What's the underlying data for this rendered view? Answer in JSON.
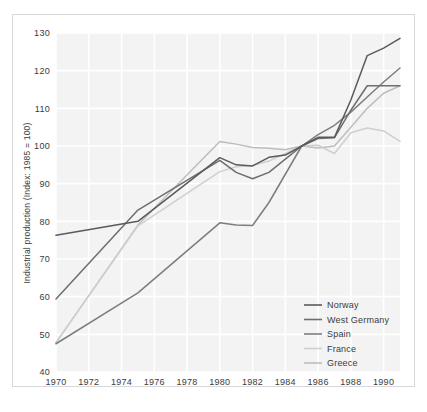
{
  "chart_data": {
    "type": "line",
    "title": "",
    "xlabel": "",
    "ylabel": "Industrial production (Index: 1985 = 100)",
    "xlim": [
      1970,
      1991
    ],
    "ylim": [
      40,
      130
    ],
    "xticks": [
      "1970",
      "1972",
      "1974",
      "1976",
      "1978",
      "1980",
      "1982",
      "1984",
      "1986",
      "1988",
      "1990"
    ],
    "yticks": [
      "40",
      "50",
      "60",
      "70",
      "80",
      "90",
      "100",
      "110",
      "120",
      "130"
    ],
    "grid": true,
    "legend_position": "bottom-right",
    "x": [
      1970,
      1975,
      1980,
      1981,
      1982,
      1983,
      1984,
      1985,
      1986,
      1987,
      1988,
      1989,
      1990,
      1991
    ],
    "series": [
      {
        "name": "Norway",
        "color": "#5a5a5a",
        "values": [
          76.3,
          80.0,
          96.9,
          95.0,
          94.7,
          97.0,
          97.6,
          100.0,
          102.3,
          102.3,
          112.2,
          124.0,
          126.0,
          128.6
        ]
      },
      {
        "name": "West Germany",
        "color": "#6e6e6e",
        "values": [
          59.4,
          83.0,
          96.2,
          93.0,
          91.3,
          93.0,
          96.5,
          100.0,
          102.0,
          102.2,
          109.5,
          116.0,
          116.0,
          116.0
        ]
      },
      {
        "name": "Spain",
        "color": "#7d7d7d",
        "values": [
          47.5,
          61.0,
          79.6,
          79.0,
          78.9,
          85.0,
          92.5,
          100.0,
          103.0,
          105.5,
          109.0,
          113.0,
          117.0,
          120.7
        ]
      },
      {
        "name": "France",
        "color": "#cfcfcf",
        "values": [
          47.8,
          78.8,
          93.2,
          94.5,
          94.8,
          96.0,
          98.0,
          100.0,
          100.2,
          98.0,
          103.5,
          104.8,
          104.0,
          101.2
        ]
      },
      {
        "name": "Greece",
        "color": "#bdbdbd",
        "values": [
          47.8,
          79.0,
          101.2,
          100.5,
          99.6,
          99.4,
          99.0,
          100.0,
          99.5,
          100.0,
          105.0,
          110.0,
          114.0,
          116.0
        ]
      }
    ]
  },
  "legend": {
    "entries": [
      {
        "label": "Norway"
      },
      {
        "label": "West Germany"
      },
      {
        "label": "Spain"
      },
      {
        "label": "France"
      },
      {
        "label": "Greece"
      }
    ]
  },
  "axes": {
    "y_label": "Industrial production (Index: 1985 = 100)"
  },
  "style": {
    "plot_background": "#f3f3f3",
    "gridline_color": "#ffffff",
    "frame_color": "#d8d8d8",
    "text_color": "#3b3b3b",
    "page_background": "#ffffff"
  }
}
